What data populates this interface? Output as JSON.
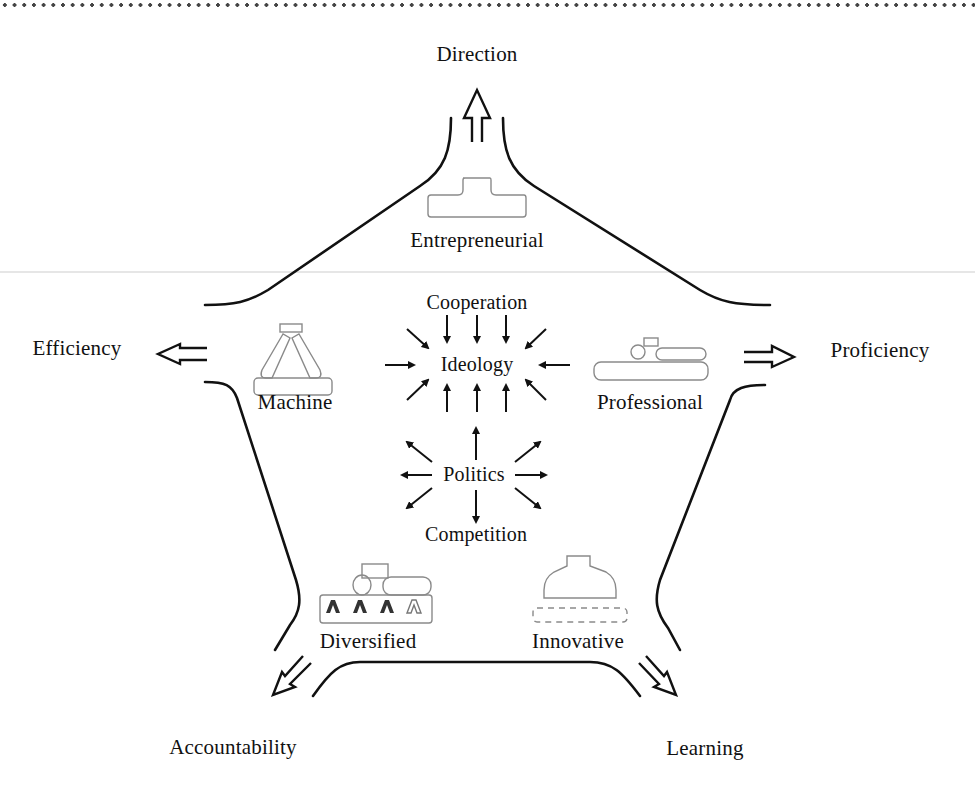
{
  "diagram": {
    "outer_forces": {
      "top": "Direction",
      "left": "Efficiency",
      "right": "Proficiency",
      "bottom_left": "Accountability",
      "bottom_right": "Learning"
    },
    "configurations": {
      "top": "Entrepreneurial",
      "left": "Machine",
      "right": "Professional",
      "bottom_left": "Diversified",
      "bottom_right": "Innovative"
    },
    "center": {
      "pulling_together_label": "Cooperation",
      "pulling_together_hub": "Ideology",
      "pulling_apart_hub": "Politics",
      "pulling_apart_label": "Competition"
    },
    "colors": {
      "line": "#111111",
      "icon_outline": "#8a8a8a",
      "background": "#ffffff"
    }
  }
}
